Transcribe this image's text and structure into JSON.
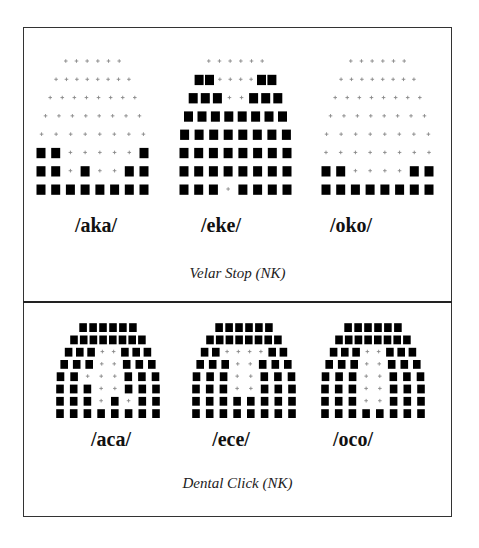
{
  "figure": {
    "panels": [
      {
        "id": "velar-stop",
        "caption": "Velar Stop (NK)",
        "items": [
          {
            "label": "/aka/",
            "grid": [
              [
                0,
                0,
                0,
                0,
                0,
                0
              ],
              [
                0,
                0,
                0,
                0,
                0,
                0,
                0,
                0
              ],
              [
                0,
                0,
                0,
                0,
                0,
                0,
                0,
                0
              ],
              [
                0,
                0,
                0,
                0,
                0,
                0,
                0,
                0
              ],
              [
                0,
                0,
                0,
                0,
                0,
                0,
                0,
                0
              ],
              [
                1,
                1,
                0,
                0,
                0,
                0,
                0,
                1
              ],
              [
                1,
                1,
                0,
                1,
                0,
                0,
                1,
                1
              ],
              [
                1,
                1,
                1,
                1,
                1,
                1,
                1,
                1
              ]
            ]
          },
          {
            "label": "/eke/",
            "grid": [
              [
                0,
                0,
                0,
                0,
                0,
                0
              ],
              [
                1,
                1,
                0,
                0,
                0,
                0,
                1,
                1
              ],
              [
                1,
                1,
                1,
                0,
                0,
                1,
                1,
                1
              ],
              [
                1,
                1,
                1,
                1,
                1,
                1,
                1,
                1
              ],
              [
                1,
                1,
                1,
                1,
                1,
                1,
                1,
                1
              ],
              [
                1,
                1,
                1,
                1,
                1,
                1,
                1,
                1
              ],
              [
                1,
                1,
                1,
                1,
                1,
                1,
                1,
                1
              ],
              [
                1,
                1,
                1,
                0,
                1,
                1,
                1,
                1
              ]
            ]
          },
          {
            "label": "/oko/",
            "grid": [
              [
                0,
                0,
                0,
                0,
                0,
                0
              ],
              [
                0,
                0,
                0,
                0,
                0,
                0,
                0,
                0
              ],
              [
                0,
                0,
                0,
                0,
                0,
                0,
                0,
                0
              ],
              [
                0,
                0,
                0,
                0,
                0,
                0,
                0,
                0
              ],
              [
                0,
                0,
                0,
                0,
                0,
                0,
                0,
                0
              ],
              [
                0,
                0,
                0,
                0,
                0,
                0,
                0,
                0
              ],
              [
                1,
                1,
                0,
                0,
                0,
                0,
                1,
                1
              ],
              [
                1,
                1,
                1,
                1,
                1,
                1,
                1,
                1
              ]
            ]
          }
        ]
      },
      {
        "id": "dental-click",
        "caption": "Dental Click (NK)",
        "items": [
          {
            "label": "/aca/",
            "grid": [
              [
                1,
                1,
                1,
                1,
                1,
                1
              ],
              [
                1,
                1,
                1,
                1,
                1,
                1,
                1,
                1
              ],
              [
                1,
                1,
                1,
                0,
                0,
                1,
                1,
                1
              ],
              [
                1,
                1,
                1,
                0,
                0,
                1,
                1,
                1
              ],
              [
                1,
                1,
                0,
                0,
                0,
                1,
                1,
                1
              ],
              [
                1,
                1,
                1,
                0,
                0,
                1,
                1,
                1
              ],
              [
                1,
                1,
                1,
                0,
                1,
                0,
                1,
                1
              ],
              [
                1,
                1,
                1,
                1,
                1,
                1,
                1,
                1
              ]
            ]
          },
          {
            "label": "/ece/",
            "grid": [
              [
                1,
                1,
                1,
                1,
                1,
                1
              ],
              [
                1,
                1,
                1,
                1,
                1,
                1,
                1,
                1
              ],
              [
                1,
                1,
                0,
                0,
                0,
                0,
                1,
                1
              ],
              [
                1,
                1,
                1,
                0,
                0,
                1,
                1,
                1
              ],
              [
                1,
                1,
                1,
                0,
                0,
                1,
                1,
                1
              ],
              [
                1,
                1,
                1,
                0,
                0,
                1,
                1,
                1
              ],
              [
                1,
                1,
                1,
                1,
                1,
                1,
                1,
                1
              ],
              [
                1,
                1,
                1,
                1,
                1,
                1,
                1,
                1
              ]
            ]
          },
          {
            "label": "/oco/",
            "grid": [
              [
                1,
                1,
                1,
                1,
                1,
                1
              ],
              [
                1,
                1,
                1,
                1,
                1,
                1,
                1,
                1
              ],
              [
                1,
                1,
                1,
                0,
                0,
                1,
                1,
                1
              ],
              [
                1,
                1,
                1,
                0,
                0,
                1,
                1,
                1
              ],
              [
                1,
                1,
                1,
                0,
                0,
                1,
                1,
                1
              ],
              [
                1,
                1,
                1,
                0,
                0,
                1,
                1,
                1
              ],
              [
                1,
                1,
                1,
                0,
                0,
                1,
                1,
                1
              ],
              [
                1,
                1,
                1,
                1,
                1,
                1,
                1,
                1
              ]
            ]
          }
        ]
      }
    ],
    "legend": {
      "contact": "black-square",
      "no_contact": "plus-mark"
    }
  }
}
